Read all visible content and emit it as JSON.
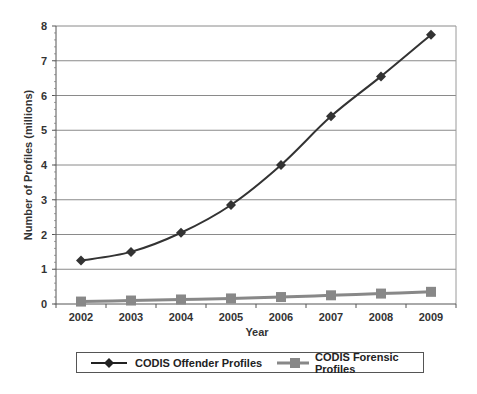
{
  "chart_data": {
    "type": "line",
    "title": "",
    "xlabel": "Year",
    "ylabel": "Number of Profiles (millions)",
    "categories": [
      "2002",
      "2003",
      "2004",
      "2005",
      "2006",
      "2007",
      "2008",
      "2009"
    ],
    "ylim": [
      0,
      8
    ],
    "yticks": [
      0,
      1,
      2,
      3,
      4,
      5,
      6,
      7,
      8
    ],
    "grid": true,
    "legend_position": "bottom",
    "series": [
      {
        "name": "CODIS Offender Profiles",
        "marker": "diamond",
        "color": "#333333",
        "values": [
          1.25,
          1.5,
          2.05,
          2.85,
          4.0,
          5.4,
          6.55,
          7.75
        ]
      },
      {
        "name": "CODIS Forensic Profiles",
        "marker": "square",
        "color": "#888888",
        "values": [
          0.07,
          0.1,
          0.13,
          0.16,
          0.2,
          0.25,
          0.3,
          0.35
        ]
      }
    ]
  },
  "legend": {
    "offender_label": "CODIS Offender Profiles",
    "forensic_label": "CODIS Forensic Profiles"
  }
}
